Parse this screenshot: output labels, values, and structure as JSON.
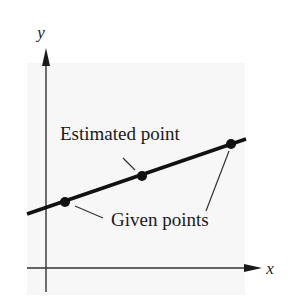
{
  "diagram": {
    "type": "linear-interpolation-figure",
    "axes": {
      "x_label": "x",
      "y_label": "y"
    },
    "labels": {
      "estimated": "Estimated point",
      "given": "Given points"
    },
    "line": {
      "x1": 27,
      "y1": 214,
      "x2": 246,
      "y2": 139
    },
    "points": [
      {
        "role": "given",
        "x": 65,
        "y": 202
      },
      {
        "role": "estimated",
        "x": 142,
        "y": 176
      },
      {
        "role": "given",
        "x": 231,
        "y": 144
      }
    ],
    "colors": {
      "ink": "#1a1a1a",
      "panel": "#f7f7f7",
      "background": "#ffffff"
    }
  }
}
